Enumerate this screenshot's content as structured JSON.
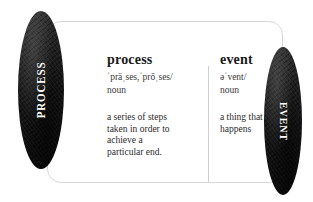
{
  "canvas": {
    "width": 313,
    "height": 202,
    "background": "#ffffff"
  },
  "theme": {
    "badge_fill": "#1c1c1c",
    "badge_text": "#ffffff",
    "card_border": "#d9d9d9",
    "divider": "#cfcfcf",
    "headword_color": "#1a1a1a",
    "body_text_color": "#2b2b2b"
  },
  "badges": {
    "left": {
      "label": "PROCESS",
      "shape": "ellipse",
      "orientation": "bottom-to-top"
    },
    "right": {
      "label": "EVENT",
      "shape": "ellipse",
      "orientation": "top-to-bottom"
    }
  },
  "card": {
    "entries": [
      {
        "headword": "process",
        "phonetic": "ˈpräˌses,ˈprōˌses/",
        "part_of_speech": "noun",
        "definition": "a series of steps\ntaken in order to\nachieve a\nparticular end."
      },
      {
        "headword": "event",
        "phonetic": "əˈvent/",
        "part_of_speech": "noun",
        "definition": "a thing that\nhappens"
      }
    ]
  }
}
